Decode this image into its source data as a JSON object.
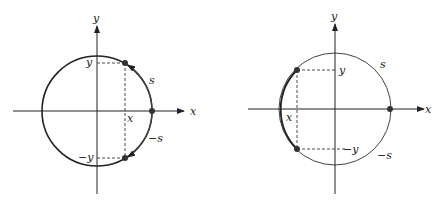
{
  "diagrams": [
    {
      "id": "left",
      "labels": {
        "y_axis": "y",
        "x_axis": "x",
        "y_value": "y",
        "neg_y_value": "−y",
        "x_value": "x",
        "arc_s": "s",
        "arc_neg_s": "−s"
      }
    },
    {
      "id": "right",
      "labels": {
        "y_axis": "y",
        "x_axis": "x",
        "y_value": "y",
        "neg_y_value": "−y",
        "x_value": "x",
        "arc_s": "s",
        "arc_neg_s": "−s"
      }
    }
  ],
  "colors": {
    "stroke": "#222222",
    "arc_highlight": "#333333",
    "point": "#333333"
  }
}
